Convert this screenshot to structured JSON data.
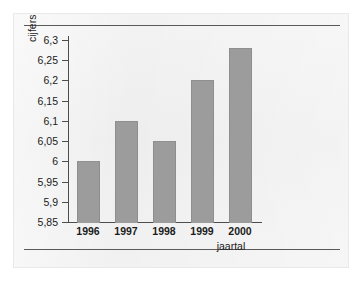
{
  "chart_data": {
    "type": "bar",
    "title": "",
    "categories": [
      "1996",
      "1997",
      "1998",
      "1999",
      "2000"
    ],
    "values": [
      6.0,
      6.1,
      6.05,
      6.2,
      6.28
    ],
    "value_labels": [
      "6",
      "6,1",
      "6,05",
      "6,2",
      "6,28"
    ],
    "xlabel": "jaartal",
    "ylabel": "cijfers",
    "ylim": [
      5.85,
      6.3
    ],
    "ytick_values": [
      6.3,
      6.25,
      6.2,
      6.15,
      6.1,
      6.05,
      6.0,
      5.95,
      5.9,
      5.85
    ],
    "ytick_labels": [
      "6,3",
      "6,25",
      "6,2",
      "6,15",
      "6,1",
      "6,05",
      "6",
      "5,95",
      "5,9",
      "5,85"
    ],
    "grid": false,
    "legend": false,
    "bar_color": "#9c9c9c",
    "axis_color": "#4d4d4d",
    "text_color": "#1b1b1b",
    "page_color": "#eeeeee",
    "rule_color": "#5a5a5a",
    "decimal_separator": ","
  }
}
